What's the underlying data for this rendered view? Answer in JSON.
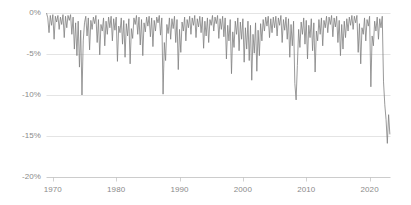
{
  "chart_data": {
    "type": "area",
    "title": "",
    "subtitle": "",
    "xlabel": "",
    "ylabel": "",
    "grid": true,
    "legend": null,
    "xlim": [
      1969.0,
      2023.3
    ],
    "ylim": [
      -20,
      0
    ],
    "ytick_labels": [
      "0%",
      "-5%",
      "-10%",
      "-15%",
      "-20%"
    ],
    "ytick_values": [
      0,
      -5,
      -10,
      -15,
      -20
    ],
    "xtick_labels": [
      "1970",
      "1980",
      "1990",
      "2000",
      "2010",
      "2020"
    ],
    "xtick_values": [
      1970,
      1980,
      1990,
      2000,
      2010,
      2020
    ],
    "series_name": "Drawdown",
    "line_color": "#808080",
    "grid_color": "#d9d9d9",
    "axis_color": "#bfbfbf",
    "label_color": "#8a8a8a",
    "annotations": [
      {
        "label": "1974 drawdown",
        "x": 1974.7,
        "y": -10.0
      },
      {
        "label": "1987 drawdown",
        "x": 1987.9,
        "y": -9.9
      },
      {
        "label": "2008 drawdown",
        "x": 2008.9,
        "y": -10.6
      },
      {
        "label": "2022 drawdown",
        "x": 2022.8,
        "y": -15.9
      }
    ],
    "x": [
      1969.0,
      1969.2,
      1969.4,
      1969.6,
      1969.8,
      1970.0,
      1970.2,
      1970.4,
      1970.6,
      1970.8,
      1971.0,
      1971.2,
      1971.4,
      1971.6,
      1971.8,
      1972.0,
      1972.2,
      1972.4,
      1972.6,
      1972.8,
      1973.0,
      1973.2,
      1973.4,
      1973.6,
      1973.8,
      1974.0,
      1974.2,
      1974.4,
      1974.6,
      1974.8,
      1975.0,
      1975.2,
      1975.4,
      1975.6,
      1975.8,
      1976.0,
      1976.2,
      1976.4,
      1976.6,
      1976.8,
      1977.0,
      1977.2,
      1977.4,
      1977.6,
      1977.8,
      1978.0,
      1978.2,
      1978.4,
      1978.6,
      1978.8,
      1979.0,
      1979.2,
      1979.4,
      1979.6,
      1979.8,
      1980.0,
      1980.2,
      1980.4,
      1980.6,
      1980.8,
      1981.0,
      1981.2,
      1981.4,
      1981.6,
      1981.8,
      1982.0,
      1982.2,
      1982.4,
      1982.6,
      1982.8,
      1983.0,
      1983.2,
      1983.4,
      1983.6,
      1983.8,
      1984.0,
      1984.2,
      1984.4,
      1984.6,
      1984.8,
      1985.0,
      1985.2,
      1985.4,
      1985.6,
      1985.8,
      1986.0,
      1986.2,
      1986.4,
      1986.6,
      1986.8,
      1987.0,
      1987.2,
      1987.4,
      1987.6,
      1987.8,
      1988.0,
      1988.2,
      1988.4,
      1988.6,
      1988.8,
      1989.0,
      1989.2,
      1989.4,
      1989.6,
      1989.8,
      1990.0,
      1990.2,
      1990.4,
      1990.6,
      1990.8,
      1991.0,
      1991.2,
      1991.4,
      1991.6,
      1991.8,
      1992.0,
      1992.2,
      1992.4,
      1992.6,
      1992.8,
      1993.0,
      1993.2,
      1993.4,
      1993.6,
      1993.8,
      1994.0,
      1994.2,
      1994.4,
      1994.6,
      1994.8,
      1995.0,
      1995.2,
      1995.4,
      1995.6,
      1995.8,
      1996.0,
      1996.2,
      1996.4,
      1996.6,
      1996.8,
      1997.0,
      1997.2,
      1997.4,
      1997.6,
      1997.8,
      1998.0,
      1998.2,
      1998.4,
      1998.6,
      1998.8,
      1999.0,
      1999.2,
      1999.4,
      1999.6,
      1999.8,
      2000.0,
      2000.2,
      2000.4,
      2000.6,
      2000.8,
      2001.0,
      2001.2,
      2001.4,
      2001.6,
      2001.8,
      2002.0,
      2002.2,
      2002.4,
      2002.6,
      2002.8,
      2003.0,
      2003.2,
      2003.4,
      2003.6,
      2003.8,
      2004.0,
      2004.2,
      2004.4,
      2004.6,
      2004.8,
      2005.0,
      2005.2,
      2005.4,
      2005.6,
      2005.8,
      2006.0,
      2006.2,
      2006.4,
      2006.6,
      2006.8,
      2007.0,
      2007.2,
      2007.4,
      2007.6,
      2007.8,
      2008.0,
      2008.2,
      2008.4,
      2008.6,
      2008.8,
      2009.0,
      2009.2,
      2009.4,
      2009.6,
      2009.8,
      2010.0,
      2010.2,
      2010.4,
      2010.6,
      2010.8,
      2011.0,
      2011.2,
      2011.4,
      2011.6,
      2011.8,
      2012.0,
      2012.2,
      2012.4,
      2012.6,
      2012.8,
      2013.0,
      2013.2,
      2013.4,
      2013.6,
      2013.8,
      2014.0,
      2014.2,
      2014.4,
      2014.6,
      2014.8,
      2015.0,
      2015.2,
      2015.4,
      2015.6,
      2015.8,
      2016.0,
      2016.2,
      2016.4,
      2016.6,
      2016.8,
      2017.0,
      2017.2,
      2017.4,
      2017.6,
      2017.8,
      2018.0,
      2018.2,
      2018.4,
      2018.6,
      2018.8,
      2019.0,
      2019.2,
      2019.4,
      2019.6,
      2019.8,
      2020.0,
      2020.2,
      2020.4,
      2020.6,
      2020.8,
      2021.0,
      2021.2,
      2021.4,
      2021.6,
      2021.8,
      2022.0,
      2022.2,
      2022.4,
      2022.6,
      2022.8,
      2023.0,
      2023.2
    ],
    "values": [
      0.0,
      -0.6,
      -2.4,
      -0.3,
      -1.5,
      -0.2,
      -3.2,
      -0.4,
      -1.1,
      -0.3,
      -2.0,
      -0.5,
      -1.4,
      -0.2,
      -3.0,
      -0.4,
      -1.8,
      -0.3,
      -0.9,
      -0.2,
      -2.6,
      -0.5,
      -4.4,
      -1.2,
      -5.2,
      -1.0,
      -6.6,
      -2.1,
      -10.0,
      -3.4,
      -1.2,
      -0.4,
      -2.8,
      -0.6,
      -4.5,
      -0.9,
      -2.0,
      -0.5,
      -1.3,
      -0.3,
      -3.6,
      -0.8,
      -5.1,
      -1.4,
      -2.2,
      -0.6,
      -4.0,
      -1.0,
      -2.6,
      -0.5,
      -1.8,
      -0.4,
      -3.4,
      -0.7,
      -2.1,
      -0.5,
      -5.9,
      -1.6,
      -2.4,
      -0.6,
      -3.8,
      -0.9,
      -5.4,
      -1.3,
      -2.8,
      -0.7,
      -6.2,
      -1.9,
      -3.1,
      -0.6,
      -1.4,
      -0.3,
      -2.6,
      -0.5,
      -3.9,
      -0.8,
      -5.2,
      -1.2,
      -2.3,
      -0.5,
      -1.6,
      -0.4,
      -2.9,
      -0.6,
      -4.1,
      -0.9,
      -2.2,
      -0.5,
      -1.2,
      -0.3,
      -2.7,
      -0.6,
      -9.9,
      -3.6,
      -5.8,
      -1.4,
      -2.5,
      -0.6,
      -3.2,
      -0.7,
      -1.9,
      -0.4,
      -3.6,
      -0.8,
      -6.9,
      -2.0,
      -4.8,
      -1.1,
      -2.2,
      -0.5,
      -3.4,
      -0.8,
      -1.8,
      -0.4,
      -2.6,
      -0.6,
      -1.5,
      -0.3,
      -3.0,
      -0.7,
      -1.7,
      -0.4,
      -2.4,
      -0.5,
      -4.3,
      -1.0,
      -2.8,
      -0.6,
      -3.6,
      -0.8,
      -1.5,
      -0.3,
      -2.2,
      -0.5,
      -1.3,
      -0.3,
      -3.1,
      -0.7,
      -2.0,
      -0.4,
      -2.9,
      -0.6,
      -5.6,
      -1.5,
      -3.4,
      -0.8,
      -7.4,
      -2.3,
      -4.2,
      -1.0,
      -2.6,
      -0.6,
      -4.6,
      -1.1,
      -3.2,
      -0.7,
      -6.0,
      -1.8,
      -4.4,
      -1.0,
      -5.8,
      -1.5,
      -8.2,
      -2.6,
      -4.9,
      -1.2,
      -7.1,
      -2.1,
      -5.2,
      -1.3,
      -3.4,
      -0.8,
      -2.2,
      -0.5,
      -1.6,
      -0.4,
      -3.0,
      -0.7,
      -2.4,
      -0.5,
      -1.8,
      -0.4,
      -2.8,
      -0.6,
      -1.5,
      -0.3,
      -3.6,
      -0.8,
      -2.1,
      -0.5,
      -3.2,
      -0.7,
      -5.4,
      -1.4,
      -4.0,
      -1.0,
      -8.6,
      -10.6,
      -6.4,
      -2.0,
      -4.2,
      -1.1,
      -2.6,
      -0.6,
      -3.8,
      -0.9,
      -5.6,
      -1.5,
      -3.0,
      -0.7,
      -4.6,
      -1.2,
      -7.2,
      -2.2,
      -3.4,
      -0.8,
      -2.6,
      -0.6,
      -4.0,
      -0.9,
      -1.8,
      -0.4,
      -2.4,
      -0.5,
      -1.4,
      -0.3,
      -2.9,
      -0.6,
      -1.7,
      -0.4,
      -3.6,
      -0.9,
      -5.2,
      -1.4,
      -4.4,
      -1.0,
      -3.0,
      -0.7,
      -2.2,
      -0.5,
      -1.5,
      -0.3,
      -2.0,
      -0.4,
      -1.2,
      -0.3,
      -4.8,
      -1.3,
      -6.2,
      -1.8,
      -2.6,
      -0.6,
      -3.4,
      -0.8,
      -1.6,
      -0.4,
      -9.0,
      -2.8,
      -4.0,
      -1.0,
      -2.2,
      -0.5,
      -3.2,
      -0.7,
      -1.8,
      -0.4,
      -8.4,
      -11.2,
      -13.0,
      -15.9,
      -12.4,
      -14.8
    ]
  }
}
